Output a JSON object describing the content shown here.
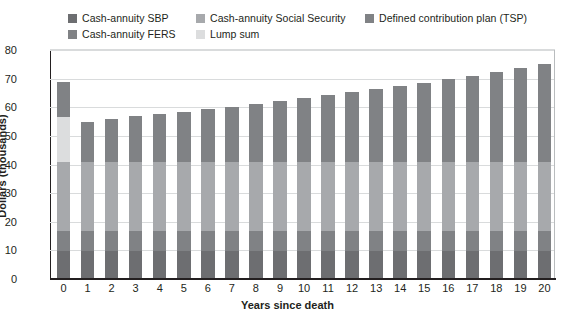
{
  "chart_data": {
    "type": "bar",
    "stacked": true,
    "title": "",
    "xlabel": "Years since death",
    "ylabel": "Dollars (thousands)",
    "ylim": [
      0,
      80
    ],
    "yticks": [
      0,
      10,
      20,
      30,
      40,
      50,
      60,
      70,
      80
    ],
    "grid": true,
    "legend_position": "top",
    "categories": [
      "0",
      "1",
      "2",
      "3",
      "4",
      "5",
      "6",
      "7",
      "8",
      "9",
      "10",
      "11",
      "12",
      "13",
      "14",
      "15",
      "16",
      "17",
      "18",
      "19",
      "20"
    ],
    "series": [
      {
        "name": "Cash-annuity SBP",
        "color": "#6d6e71",
        "values": [
          9.8,
          9.8,
          9.8,
          9.8,
          9.8,
          9.8,
          9.8,
          9.8,
          9.8,
          9.8,
          9.8,
          9.8,
          9.8,
          9.8,
          9.8,
          9.8,
          9.8,
          9.8,
          9.8,
          9.8,
          9.8
        ]
      },
      {
        "name": "Cash-annuity FERS",
        "color": "#808285",
        "values": [
          7.0,
          7.0,
          7.0,
          7.0,
          7.0,
          7.0,
          7.0,
          7.0,
          7.0,
          7.0,
          7.0,
          7.0,
          7.0,
          7.0,
          7.0,
          7.0,
          7.0,
          7.0,
          7.0,
          7.0,
          7.0
        ]
      },
      {
        "name": "Cash-annuity Social Security",
        "color": "#a7a9ac",
        "values": [
          24.0,
          24.0,
          24.0,
          24.0,
          24.0,
          24.0,
          24.0,
          24.0,
          24.0,
          24.0,
          24.0,
          24.0,
          24.0,
          24.0,
          24.0,
          24.0,
          24.0,
          24.0,
          24.0,
          24.0,
          24.0
        ]
      },
      {
        "name": "Lump sum",
        "color": "#dcddde",
        "values": [
          15.8,
          0,
          0,
          0,
          0,
          0,
          0,
          0,
          0,
          0,
          0,
          0,
          0,
          0,
          0,
          0,
          0,
          0,
          0,
          0,
          0
        ]
      },
      {
        "name": "Defined contribution plan (TSP)",
        "color": "#808285",
        "values": [
          12.4,
          14.2,
          15.1,
          16.0,
          16.8,
          17.6,
          18.5,
          19.4,
          20.4,
          21.4,
          22.4,
          23.5,
          24.5,
          25.6,
          26.7,
          27.8,
          29.0,
          30.3,
          31.6,
          32.9,
          34.3
        ]
      }
    ],
    "totals": [
      69.0,
      55.0,
      55.9,
      56.8,
      57.6,
      58.4,
      59.3,
      60.2,
      61.2,
      62.2,
      63.2,
      64.3,
      65.3,
      66.4,
      67.5,
      68.6,
      69.8,
      71.1,
      72.4,
      73.7,
      75.1
    ]
  },
  "legend": {
    "columns": [
      [
        {
          "label": "Cash-annuity SBP",
          "color": "#6d6e71",
          "icon": "legend-swatch-icon"
        },
        {
          "label": "Cash-annuity FERS",
          "color": "#808285",
          "icon": "legend-swatch-icon"
        }
      ],
      [
        {
          "label": "Cash-annuity Social Security",
          "color": "#a7a9ac",
          "icon": "legend-swatch-icon"
        },
        {
          "label": "Lump sum",
          "color": "#dcddde",
          "icon": "legend-swatch-icon"
        }
      ],
      [
        {
          "label": "Defined contribution plan (TSP)",
          "color": "#808285",
          "icon": "legend-swatch-icon"
        }
      ]
    ]
  },
  "colors": {
    "axis": "#231f20",
    "gridline": "#d9dbdc",
    "plot_background": "#ffffff",
    "text": "#231f20"
  }
}
